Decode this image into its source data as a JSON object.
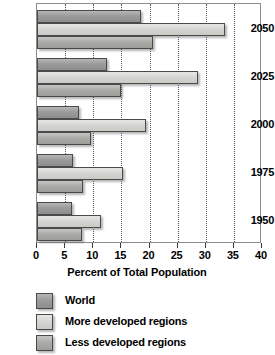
{
  "chart_data": {
    "type": "bar",
    "orientation": "horizontal",
    "title": "",
    "xlabel": "Percent of Total Population",
    "ylabel": "",
    "xlim": [
      0,
      40
    ],
    "xticks": [
      0,
      5,
      10,
      15,
      20,
      25,
      30,
      35,
      40
    ],
    "xtick_labels": [
      "0",
      "5",
      "10",
      "15",
      "20",
      "25",
      "30",
      "35",
      "40"
    ],
    "grid": true,
    "grid_axis": "x",
    "legend_position": "bottom-left",
    "categories": [
      "2050",
      "2025",
      "2000",
      "1975",
      "1950"
    ],
    "series": [
      {
        "name": "World",
        "values": [
          18.5,
          12.5,
          7.5,
          6.4,
          6.2
        ]
      },
      {
        "name": "More developed regions",
        "values": [
          33.4,
          28.6,
          19.4,
          15.3,
          11.4
        ]
      },
      {
        "name": "Less developed regions",
        "values": [
          20.6,
          15.0,
          9.6,
          8.2,
          8.0
        ]
      }
    ]
  },
  "legend": {
    "items": [
      {
        "label": "World",
        "swatch": "world"
      },
      {
        "label": "More developed regions",
        "swatch": "more"
      },
      {
        "label": "Less developed regions",
        "swatch": "less"
      }
    ]
  },
  "colors": {
    "world": "#9b9b9b",
    "more_developed": "#d6d6d2",
    "less_developed": "#ababa8",
    "axis": "#3a3a3a",
    "grid": "#55555a",
    "plot_border": "#8c8c8c",
    "text": "#000000",
    "background": "#ffffff"
  }
}
